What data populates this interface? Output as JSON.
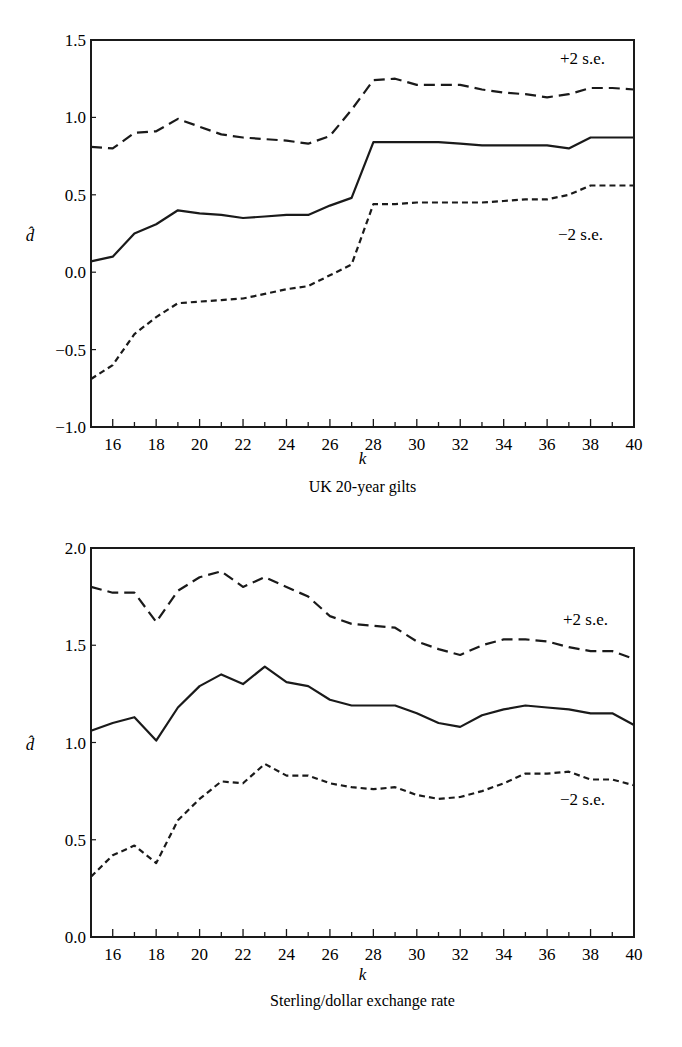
{
  "chart_data": [
    {
      "type": "line",
      "title": "UK 20-year gilts",
      "xlabel": "k",
      "ylabel": "d̂",
      "xlim": [
        15,
        40
      ],
      "ylim": [
        -1.0,
        1.5
      ],
      "grid": false,
      "x_ticks": [
        16,
        18,
        20,
        22,
        24,
        26,
        28,
        30,
        32,
        34,
        36,
        38,
        40
      ],
      "y_ticks": [
        "1.5",
        "1.0",
        "0.5",
        "0.0",
        "-0.5",
        "-1.0"
      ],
      "annotations": [
        "+2 s.e.",
        "−2 s.e."
      ],
      "x": [
        15,
        16,
        17,
        18,
        19,
        20,
        21,
        22,
        23,
        24,
        25,
        26,
        27,
        28,
        29,
        30,
        31,
        32,
        33,
        34,
        35,
        36,
        37,
        38,
        39,
        40
      ],
      "series": [
        {
          "name": "+2 s.e.",
          "style": "dashed",
          "values": [
            0.81,
            0.8,
            0.9,
            0.91,
            0.99,
            0.94,
            0.89,
            0.87,
            0.86,
            0.85,
            0.83,
            0.88,
            1.05,
            1.24,
            1.25,
            1.21,
            1.21,
            1.21,
            1.18,
            1.16,
            1.15,
            1.13,
            1.15,
            1.19,
            1.19,
            1.18
          ]
        },
        {
          "name": "d̂",
          "style": "solid",
          "values": [
            0.07,
            0.1,
            0.25,
            0.31,
            0.4,
            0.38,
            0.37,
            0.35,
            0.36,
            0.37,
            0.37,
            0.43,
            0.48,
            0.84,
            0.84,
            0.84,
            0.84,
            0.83,
            0.82,
            0.82,
            0.82,
            0.82,
            0.8,
            0.87,
            0.87,
            0.87
          ]
        },
        {
          "name": "−2 s.e.",
          "style": "dotted",
          "values": [
            -0.69,
            -0.6,
            -0.4,
            -0.29,
            -0.2,
            -0.19,
            -0.18,
            -0.17,
            -0.14,
            -0.11,
            -0.09,
            -0.02,
            0.05,
            0.44,
            0.44,
            0.45,
            0.45,
            0.45,
            0.45,
            0.46,
            0.47,
            0.47,
            0.5,
            0.56,
            0.56,
            0.56
          ]
        }
      ]
    },
    {
      "type": "line",
      "title": "Sterling/dollar exchange rate",
      "xlabel": "k",
      "ylabel": "d̂",
      "xlim": [
        15,
        40
      ],
      "ylim": [
        0.0,
        2.0
      ],
      "grid": false,
      "x_ticks": [
        16,
        18,
        20,
        22,
        24,
        26,
        28,
        30,
        32,
        34,
        36,
        38,
        40
      ],
      "y_ticks": [
        "2.0",
        "1.5",
        "1.0",
        "0.5",
        "0.0"
      ],
      "annotations": [
        "+2 s.e.",
        "−2 s.e."
      ],
      "x": [
        15,
        16,
        17,
        18,
        19,
        20,
        21,
        22,
        23,
        24,
        25,
        26,
        27,
        28,
        29,
        30,
        31,
        32,
        33,
        34,
        35,
        36,
        37,
        38,
        39,
        40
      ],
      "series": [
        {
          "name": "+2 s.e.",
          "style": "dashed",
          "values": [
            1.8,
            1.77,
            1.77,
            1.62,
            1.78,
            1.85,
            1.88,
            1.8,
            1.85,
            1.8,
            1.75,
            1.65,
            1.61,
            1.6,
            1.59,
            1.52,
            1.48,
            1.45,
            1.5,
            1.53,
            1.53,
            1.52,
            1.49,
            1.47,
            1.47,
            1.43
          ]
        },
        {
          "name": "d̂",
          "style": "solid",
          "values": [
            1.06,
            1.1,
            1.13,
            1.01,
            1.18,
            1.29,
            1.35,
            1.3,
            1.39,
            1.31,
            1.29,
            1.22,
            1.19,
            1.19,
            1.19,
            1.15,
            1.1,
            1.08,
            1.14,
            1.17,
            1.19,
            1.18,
            1.17,
            1.15,
            1.15,
            1.09
          ]
        },
        {
          "name": "−2 s.e.",
          "style": "dotted",
          "values": [
            0.31,
            0.42,
            0.47,
            0.38,
            0.6,
            0.71,
            0.8,
            0.79,
            0.89,
            0.83,
            0.83,
            0.79,
            0.77,
            0.76,
            0.77,
            0.73,
            0.71,
            0.72,
            0.75,
            0.79,
            0.84,
            0.84,
            0.85,
            0.81,
            0.81,
            0.78
          ]
        }
      ]
    }
  ]
}
